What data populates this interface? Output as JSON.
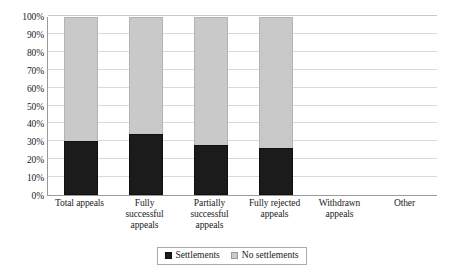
{
  "chart_data": {
    "type": "bar",
    "subtype": "stacked-100-percent",
    "title": "",
    "subtitle": "",
    "xlabel": "",
    "ylabel": "",
    "ylim": [
      0,
      100
    ],
    "grid": true,
    "legend_position": "bottom",
    "categories": [
      "Total appeals",
      "Fully successful appeals",
      "Partially successful appeals",
      "Fully rejected appeals",
      "Withdrawn appeals",
      "Other"
    ],
    "category_lines": [
      [
        "Total appeals"
      ],
      [
        "Fully",
        "successful",
        "appeals"
      ],
      [
        "Partially",
        "successful",
        "appeals"
      ],
      [
        "Fully rejected",
        "appeals"
      ],
      [
        "Withdrawn",
        "appeals"
      ],
      [
        "Other"
      ]
    ],
    "series": [
      {
        "name": "Settlements",
        "color": "#1b1b1b",
        "values": [
          30,
          34,
          28,
          26,
          null,
          null
        ]
      },
      {
        "name": "No settlements",
        "color": "#c9c9c9",
        "values": [
          70,
          66,
          72,
          74,
          null,
          null
        ]
      }
    ],
    "y_ticks": [
      "0%",
      "10%",
      "20%",
      "30%",
      "40%",
      "50%",
      "60%",
      "70%",
      "80%",
      "90%",
      "100%"
    ],
    "y_tick_values": [
      0,
      10,
      20,
      30,
      40,
      50,
      60,
      70,
      80,
      90,
      100
    ]
  },
  "legend": {
    "items": [
      {
        "label": "Settlements",
        "color": "#1b1b1b"
      },
      {
        "label": "No settlements",
        "color": "#c9c9c9"
      }
    ]
  }
}
